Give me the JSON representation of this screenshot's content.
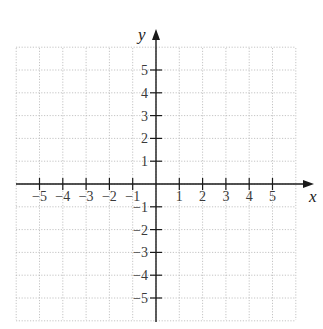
{
  "diagram": {
    "type": "coordinate-plane",
    "x_axis": {
      "label": "x",
      "ticks": [
        -5,
        -4,
        -3,
        -2,
        -1,
        1,
        2,
        3,
        4,
        5
      ],
      "tick_labels": [
        "−5",
        "−4",
        "−3",
        "−2",
        "−1",
        "1",
        "2",
        "3",
        "4",
        "5"
      ],
      "arrow": "positive"
    },
    "y_axis": {
      "label": "y",
      "ticks": [
        5,
        4,
        3,
        2,
        1,
        -1,
        -2,
        -3,
        -4,
        -5
      ],
      "tick_labels": [
        "5",
        "4",
        "3",
        "2",
        "1",
        "−1",
        "−2",
        "−3",
        "−4",
        "−5"
      ],
      "arrow": "positive"
    },
    "grid": {
      "style": "dotted",
      "range_x": [
        -6,
        6
      ],
      "range_y": [
        -6,
        6
      ]
    },
    "colors": {
      "axis": "#1a1a1a",
      "grid": "#b5b5b5",
      "text": "#3a3a3a"
    }
  }
}
